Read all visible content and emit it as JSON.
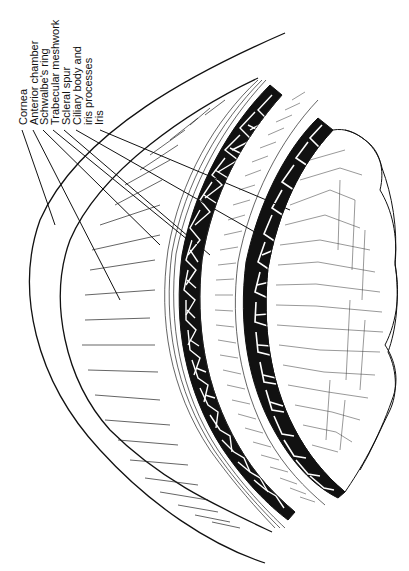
{
  "figure": {
    "type": "anatomical line drawing",
    "ink_color": "#111111",
    "background": "#ffffff"
  },
  "labels": [
    {
      "id": "cornea",
      "text": "Cornea"
    },
    {
      "id": "anterior-chamber",
      "text": "Anterior chamber"
    },
    {
      "id": "schwalbes-ring",
      "text": "Schwalbe's ring"
    },
    {
      "id": "trabecular-meshwork",
      "text": "Trabecular  meshwork"
    },
    {
      "id": "scleral-spur",
      "text": "Scleral spur"
    },
    {
      "id": "ciliary-body",
      "text": "Ciliary body and"
    },
    {
      "id": "ciliary-body-line2",
      "text": "iris processes"
    },
    {
      "id": "iris",
      "text": "Iris"
    }
  ]
}
